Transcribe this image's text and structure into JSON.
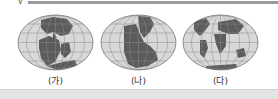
{
  "figure": {
    "panels": [
      {
        "label": "(가)",
        "description": "globe map of supercontinent breakup, early stage"
      },
      {
        "label": "(나)",
        "description": "globe map of Pangaea supercontinent"
      },
      {
        "label": "(다)",
        "description": "globe map of present-day continents"
      }
    ]
  },
  "colors": {
    "ocean": "#d8d8d8",
    "land": "#5c5c5c",
    "grid": "#8a8a8a"
  }
}
